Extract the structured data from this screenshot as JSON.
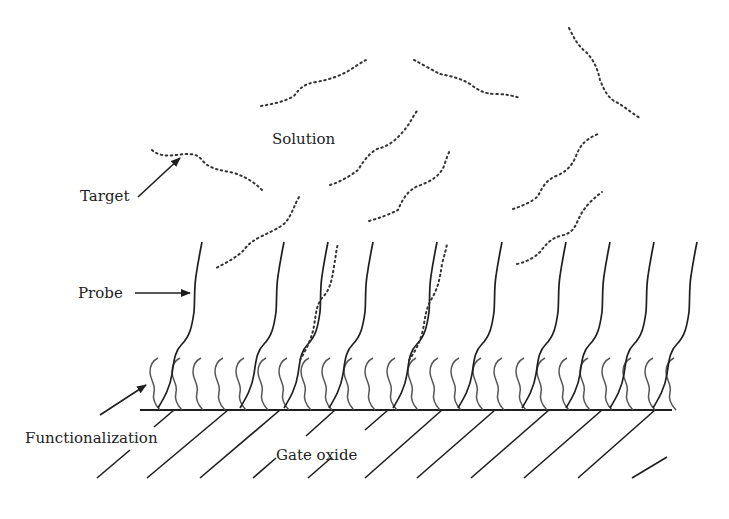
{
  "diagram": {
    "title": "",
    "labels": {
      "solution": "Solution",
      "target": "Target",
      "probe": "Probe",
      "functionalization": "Functionalization",
      "gate_oxide": "Gate oxide"
    },
    "colors": {
      "line": "#1e1e1e",
      "functionalization": "#555555",
      "target_dots": "#333333",
      "background": "#ffffff"
    },
    "elements": {
      "probe_count": 11,
      "functionalization_count": 28,
      "free_targets_in_solution": 9,
      "bound_targets": 2,
      "hatch_lines": 11
    }
  }
}
